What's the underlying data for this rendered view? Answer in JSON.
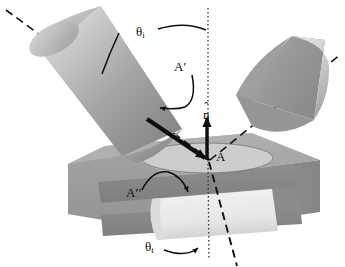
{
  "figure": {
    "domain": "optics-ray-diagram"
  },
  "labels": {
    "theta_i": {
      "symbol": "θ",
      "subscript": "i",
      "name": "angle-of-incidence"
    },
    "theta_t": {
      "symbol": "θ",
      "subscript": "t",
      "name": "angle-of-transmission"
    },
    "n_hat": {
      "symbol": "n",
      "accent": "ˆ",
      "name": "surface-normal-unit-vector"
    },
    "area_A": {
      "text": "A",
      "name": "incident-beam-cross-section-area"
    },
    "area_A_prime": {
      "text": "A",
      "primes": "′",
      "name": "reflected-beam-cross-section-area"
    },
    "area_A_double_prime": {
      "text": "A",
      "primes": "′′",
      "name": "transmitted-beam-cross-section-area"
    }
  },
  "elements": {
    "incident_beam": "incident light beam cylinder",
    "reflected_beam": "reflected light beam cylinder",
    "transmitted_beam": "transmitted light beam inside slab",
    "slab": "dielectric slab block",
    "spot_ellipse": "illuminated elliptical spot on surface",
    "normal_line": "dotted vertical normal line",
    "incident_axis": "dashed incident ray axis",
    "reflected_axis": "dashed reflected ray axis",
    "refracted_axis": "dashed refracted ray axis",
    "incident_arrow": "solid incident ray arrow",
    "normal_arrow": "solid normal unit vector arrow"
  },
  "colors": {
    "background": "#ffffff",
    "ink": "#0d0d0d",
    "beam_light": "#e3e3e3",
    "beam_mid": "#a8a8a8",
    "beam_dark": "#8a8a8a",
    "slab_top": "#adadad",
    "slab_front": "#9a9a9a",
    "slab_side": "#8e8e8e",
    "slab_cavity": "#8a8a8a",
    "spot_fill": "#cfcfcf",
    "transmitted_fill": "#eeeeee"
  }
}
